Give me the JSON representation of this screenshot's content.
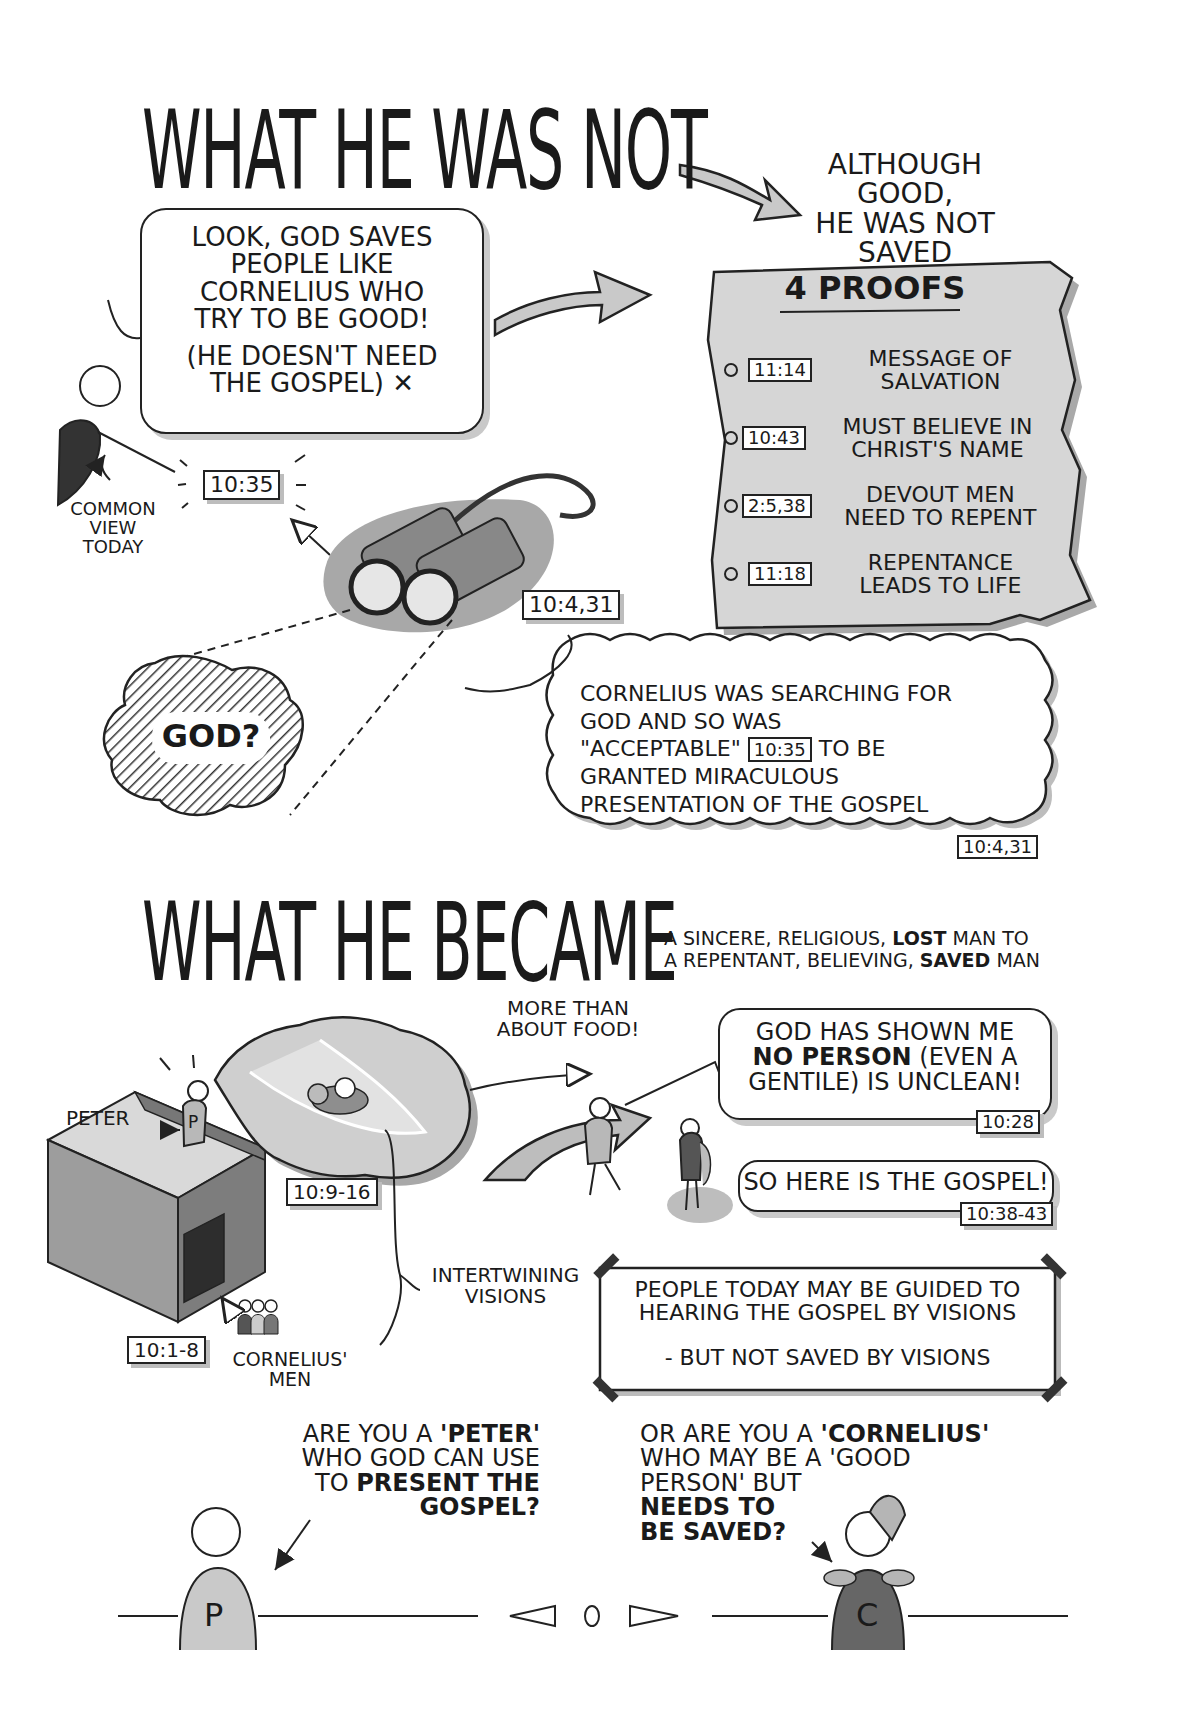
{
  "section1": {
    "title": "WHAT HE WAS NOT",
    "callout": [
      "ALTHOUGH GOOD,",
      "HE WAS NOT",
      "SAVED"
    ],
    "speech_bubble": {
      "lines": [
        "LOOK, GOD SAVES",
        "PEOPLE LIKE",
        "CORNELIUS WHO",
        "TRY TO BE GOOD!"
      ],
      "aside": [
        "(HE DOESN'T NEED",
        "THE GOSPEL)"
      ],
      "mark": "✕"
    },
    "common_view_label": [
      "COMMON",
      "VIEW",
      "TODAY"
    ],
    "ref_speaker": "10:35",
    "ref_binoculars": "10:4,31",
    "god_cloud_label": "GOD?",
    "proofs": {
      "title": "4 PROOFS",
      "items": [
        {
          "ref": "11:14",
          "text": [
            "MESSAGE OF",
            "SALVATION"
          ]
        },
        {
          "ref": "10:43",
          "text": [
            "MUST BELIEVE IN",
            "CHRIST'S NAME"
          ]
        },
        {
          "ref": "2:5,38",
          "text": [
            "DEVOUT MEN",
            "NEED TO REPENT"
          ]
        },
        {
          "ref": "11:18",
          "text": [
            "REPENTANCE",
            "LEADS TO LIFE"
          ]
        }
      ]
    },
    "thought": {
      "line1": "CORNELIUS WAS SEARCHING FOR",
      "line2": "GOD AND SO WAS",
      "line3_pre": "\"ACCEPTABLE\"",
      "line3_ref": "10:35",
      "line3_post": "TO BE",
      "line4": "GRANTED MIRACULOUS",
      "line5": "PRESENTATION OF THE GOSPEL",
      "ref": "10:4,31"
    }
  },
  "section2": {
    "title": "WHAT HE BECAME",
    "subtitle": {
      "line1_pre": "A SINCERE, RELIGIOUS,",
      "line1_bold": "LOST",
      "line1_post": "MAN TO",
      "line2_pre": "A REPENTANT, BELIEVING,",
      "line2_bold": "SAVED",
      "line2_post": "MAN"
    },
    "more_than_food": [
      "MORE THAN",
      "ABOUT FOOD!"
    ],
    "peter_label": "PETER",
    "peter_initial": "P",
    "ref_vision": "10:9-16",
    "ref_men": "10:1-8",
    "cornelius_men_label": [
      "CORNELIUS'",
      "MEN"
    ],
    "intertwining_label": [
      "INTERTWINING",
      "VISIONS"
    ],
    "speech1": {
      "line1": "GOD HAS SHOWN ME",
      "line2_bold": "NO PERSON",
      "line2_post": "(EVEN A",
      "line3": "GENTILE) IS UNCLEAN!",
      "ref": "10:28"
    },
    "speech2": {
      "text": "SO HERE IS THE GOSPEL!",
      "ref": "10:38-43"
    },
    "note": {
      "line1": "PEOPLE TODAY MAY BE GUIDED TO",
      "line2": "HEARING THE GOSPEL BY VISIONS",
      "line3": "- BUT NOT SAVED BY VISIONS"
    }
  },
  "closing": {
    "peter_question": {
      "l1_pre": "ARE YOU A",
      "l1_bold": "'PETER'",
      "l2": "WHO GOD CAN USE",
      "l3_pre": "TO",
      "l3_bold": "PRESENT THE",
      "l4_bold": "GOSPEL?"
    },
    "cornelius_question": {
      "l1_pre": "OR ARE YOU A",
      "l1_bold": "'CORNELIUS'",
      "l2": "WHO MAY BE A 'GOOD",
      "l3": "PERSON' BUT",
      "l4_bold": "NEEDS TO",
      "l5_bold": "BE SAVED?"
    },
    "peter_initial": "P",
    "cornelius_initial": "C"
  },
  "colors": {
    "ink": "#1a1a1a",
    "light_gray": "#d4d4d4",
    "mid_gray": "#a8a8a8",
    "dark_gray": "#5a5a5a",
    "shadow": "#c2c2c2"
  }
}
